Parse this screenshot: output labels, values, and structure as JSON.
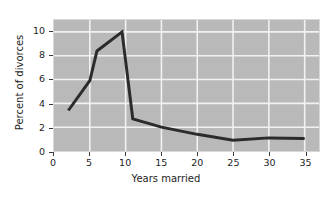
{
  "chart_data": {
    "type": "line",
    "title": "",
    "xlabel": "Years married",
    "ylabel": "Percent of divorces",
    "xlim": [
      0,
      37
    ],
    "ylim": [
      0,
      11
    ],
    "grid": true,
    "legend": "none",
    "xticks": [
      0,
      5,
      10,
      15,
      20,
      25,
      30,
      35
    ],
    "xtick_labels": [
      "0",
      "5",
      "10",
      "15",
      "20",
      "25",
      "30",
      "35"
    ],
    "yticks": [
      0,
      2,
      4,
      6,
      8,
      10
    ],
    "ytick_labels": [
      "0",
      "2",
      "4",
      "6",
      "8",
      "10"
    ],
    "series": [
      {
        "name": "Percent of divorces",
        "color": "#2b2b2b",
        "x": [
          2,
          5,
          6,
          9.5,
          11,
          15,
          20,
          25,
          30,
          35
        ],
        "values": [
          3.4,
          5.9,
          8.4,
          10.0,
          2.7,
          2.0,
          1.4,
          0.9,
          1.1,
          1.05
        ]
      }
    ],
    "colors": {
      "line": "#2b2b2b",
      "plot_background": "#b9b9b9",
      "gridline": "#f2f2f2",
      "axis": "#3a3a3a",
      "text": "#1d1d1d"
    }
  }
}
